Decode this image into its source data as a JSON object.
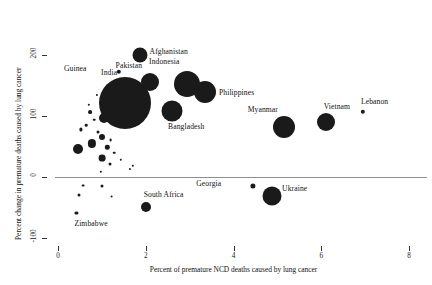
{
  "chart_data": {
    "type": "scatter",
    "title": "",
    "xlabel": "Percent of premature NCD deaths caused by lung cancer",
    "ylabel": "Percent change in premature deaths caused by lung cancer",
    "xlim": [
      0,
      8
    ],
    "ylim": [
      -100,
      200
    ],
    "xticks": [
      0,
      2,
      4,
      6,
      8
    ],
    "xtick_labels": [
      "0",
      "2",
      "4",
      "6",
      "8"
    ],
    "yticks": [
      -100,
      0,
      100,
      200
    ],
    "ytick_labels": [
      "-100",
      "0",
      "100",
      "200"
    ],
    "grid": false,
    "legend": "none",
    "reference_line_y": 0,
    "size_encoding": "bubble area proportional to number of premature lung cancer deaths",
    "points": [
      {
        "label": "Afghanistan",
        "x": 1.86,
        "y": 200,
        "r": 7.5,
        "label_dx": 10,
        "label_dy": -3
      },
      {
        "label": "Guinea",
        "x": 1.38,
        "y": 172,
        "r": 2.2,
        "label_dx": -32,
        "label_dy": -3
      },
      {
        "label": "Pakistan",
        "x": 2.1,
        "y": 155,
        "r": 9.0,
        "label_dx": -8,
        "label_dy": -16
      },
      {
        "label": "Indonesia",
        "x": 2.95,
        "y": 152,
        "r": 13.0,
        "label_dx": -8,
        "label_dy": -22
      },
      {
        "label": "Philippines",
        "x": 3.35,
        "y": 140,
        "r": 11.0,
        "label_dx": 14,
        "label_dy": 1
      },
      {
        "label": "India",
        "x": 1.53,
        "y": 122,
        "r": 26.0,
        "label_dx": -8,
        "label_dy": -30
      },
      {
        "label": "Bangladesh",
        "x": 2.6,
        "y": 108,
        "r": 10.5,
        "label_dx": -4,
        "label_dy": 16
      },
      {
        "label": "Myanmar",
        "x": 5.15,
        "y": 82,
        "r": 11.0,
        "label_dx": -6,
        "label_dy": -17
      },
      {
        "label": "Vietnam",
        "x": 6.1,
        "y": 90,
        "r": 9.0,
        "label_dx": -2,
        "label_dy": -15
      },
      {
        "label": "Lebanon",
        "x": 6.95,
        "y": 107,
        "r": 2.2,
        "label_dx": -2,
        "label_dy": -10
      },
      {
        "label": "South Africa",
        "x": 2.0,
        "y": -49,
        "r": 5.0,
        "label_dx": -2,
        "label_dy": -12
      },
      {
        "label": "Georgia",
        "x": 4.45,
        "y": -14,
        "r": 2.6,
        "label_dx": -32,
        "label_dy": -2
      },
      {
        "label": "Ukraine",
        "x": 4.88,
        "y": -31,
        "r": 9.5,
        "label_dx": 10,
        "label_dy": -7
      },
      {
        "label": "Zimbabwe",
        "x": 0.42,
        "y": -59,
        "r": 1.6,
        "label_dx": -2,
        "label_dy": 11
      }
    ],
    "unlabeled_points": [
      {
        "x": 1.05,
        "y": 97,
        "r": 5.0
      },
      {
        "x": 0.74,
        "y": 107,
        "r": 1.9
      },
      {
        "x": 0.82,
        "y": 94,
        "r": 1.3
      },
      {
        "x": 0.64,
        "y": 85,
        "r": 1.3
      },
      {
        "x": 0.53,
        "y": 78,
        "r": 1.6
      },
      {
        "x": 0.92,
        "y": 73,
        "r": 1.5
      },
      {
        "x": 1.0,
        "y": 65,
        "r": 3.0
      },
      {
        "x": 1.2,
        "y": 60,
        "r": 1.4
      },
      {
        "x": 0.77,
        "y": 55,
        "r": 4.1
      },
      {
        "x": 1.12,
        "y": 49,
        "r": 2.2
      },
      {
        "x": 0.45,
        "y": 46,
        "r": 5.0
      },
      {
        "x": 1.28,
        "y": 40,
        "r": 1.3
      },
      {
        "x": 1.0,
        "y": 31,
        "r": 3.4
      },
      {
        "x": 1.43,
        "y": 28,
        "r": 1.2
      },
      {
        "x": 1.18,
        "y": 21,
        "r": 1.5
      },
      {
        "x": 1.7,
        "y": 18,
        "r": 1.2
      },
      {
        "x": 0.98,
        "y": 9,
        "r": 1.2
      },
      {
        "x": 1.63,
        "y": 13,
        "r": 1.1
      },
      {
        "x": 0.57,
        "y": -14,
        "r": 1.4
      },
      {
        "x": 1.0,
        "y": -14,
        "r": 1.5
      },
      {
        "x": 0.48,
        "y": -30,
        "r": 1.5
      },
      {
        "x": 1.22,
        "y": -32,
        "r": 1.4
      },
      {
        "x": 0.88,
        "y": 134,
        "r": 1.1
      },
      {
        "x": 0.7,
        "y": 118,
        "r": 1.2
      }
    ]
  }
}
